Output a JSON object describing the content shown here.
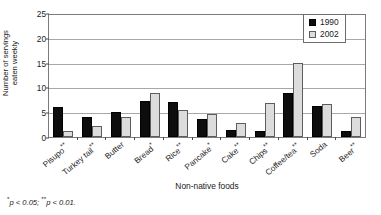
{
  "chart_data": {
    "type": "bar",
    "title": "",
    "subtitle": "",
    "xlabel": "Non-native foods",
    "ylabel": "Number of servings\neaten weekly",
    "ylim": [
      0,
      25
    ],
    "yticks": [
      0,
      5,
      10,
      15,
      20,
      25
    ],
    "grid": true,
    "legend_position": "top-right",
    "categories": [
      "Pisupo**",
      "Turkey tail**",
      "Butter",
      "Bread*",
      "Rice**",
      "Pancake*",
      "Cake**",
      "Chips**",
      "Coffee/tea**",
      "Soda",
      "Beer**"
    ],
    "category_bases": [
      "Pisupo",
      "Turkey tail",
      "Butter",
      "Bread",
      "Rice",
      "Pancake",
      "Cake",
      "Chips",
      "Coffee/tea",
      "Soda",
      "Beer"
    ],
    "category_marks": [
      "**",
      "**",
      "",
      "*",
      "**",
      "*",
      "**",
      "**",
      "**",
      "",
      "**"
    ],
    "series": [
      {
        "name": "1990",
        "color": "#0d0d0d",
        "values": [
          6.0,
          4.0,
          5.0,
          7.2,
          7.0,
          3.6,
          1.4,
          1.2,
          8.8,
          6.3,
          1.3
        ]
      },
      {
        "name": "2002",
        "color": "#dcdcdc",
        "values": [
          1.3,
          2.3,
          4.0,
          8.8,
          5.4,
          4.7,
          2.9,
          6.8,
          15.0,
          6.6,
          4.0
        ]
      }
    ],
    "annotations": {
      "footnote_mark_1": "*",
      "footnote_text_1": "p < 0.05;",
      "footnote_mark_2": "**",
      "footnote_text_2": "p < 0.01."
    }
  },
  "legend": {
    "items": [
      {
        "label": "1990"
      },
      {
        "label": "2002"
      }
    ]
  }
}
